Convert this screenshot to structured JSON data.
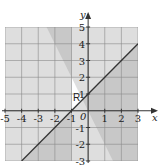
{
  "diagram": {
    "type": "inequality-region-graph",
    "x_axis_label": "x",
    "y_axis_label": "y",
    "origin_label": "0",
    "x_range": [
      -5,
      3
    ],
    "y_range": [
      -3,
      5
    ],
    "x_ticks": [
      "-5",
      "-4",
      "-3",
      "-2",
      "-1",
      "1",
      "2",
      "3"
    ],
    "y_ticks": [
      "5",
      "4",
      "3",
      "2",
      "1",
      "-1",
      "-2",
      "-3"
    ],
    "x_tick_values": [
      -5,
      -4,
      -3,
      -2,
      -1,
      1,
      2,
      3
    ],
    "y_tick_values": [
      5,
      4,
      3,
      2,
      1,
      -1,
      -2,
      -3
    ],
    "lines": [
      {
        "name": "line-y-eq-x-plus-1",
        "equation": "y = x + 1",
        "drawn": true
      },
      {
        "name": "line-x-eq-minus-1",
        "equation": "x = -1",
        "drawn": false
      },
      {
        "name": "line-y-eq-minus-2x",
        "equation": "y = -2x",
        "drawn": false
      }
    ],
    "shaded_regions": [
      "x < -1",
      "y < x + 1",
      "y > -2x"
    ],
    "region_label": "R",
    "colors": {
      "shade": "#9a9a9a",
      "grid": "#8a8a8a",
      "axis": "#333333",
      "line": "#333333",
      "background": "#ffffff"
    }
  }
}
